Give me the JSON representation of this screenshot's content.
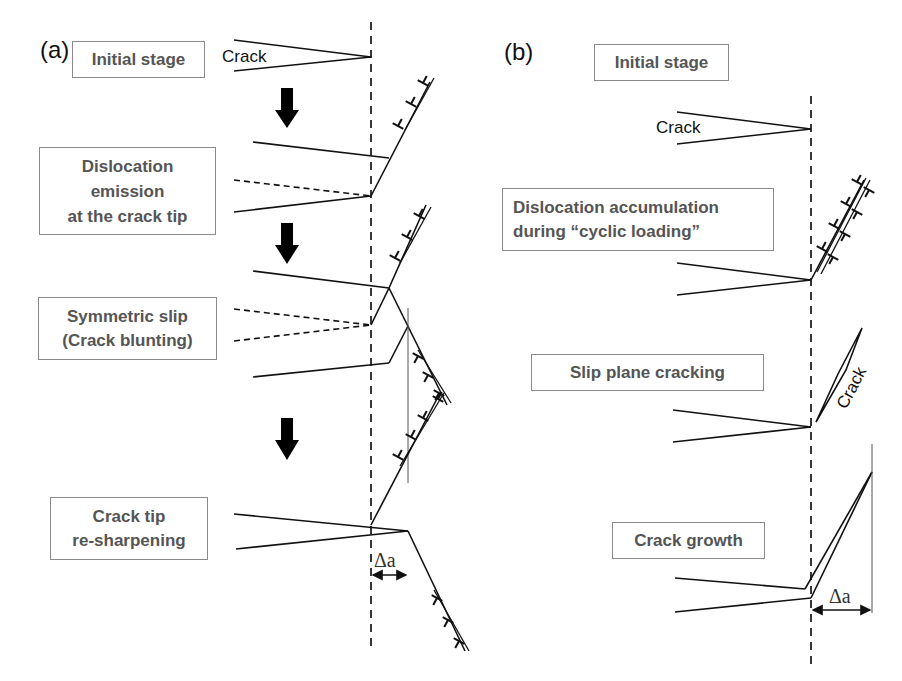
{
  "figure": {
    "panel_a": {
      "label": "(a)",
      "stages": [
        {
          "title": "Initial stage"
        },
        {
          "title": "Dislocation\nemission\nat the crack tip"
        },
        {
          "title": "Symmetric slip\n(Crack blunting)"
        },
        {
          "title": "Crack tip\nre-sharpening"
        }
      ],
      "crack_label": "Crack",
      "delta_label": "Δa"
    },
    "panel_b": {
      "label": "(b)",
      "stages": [
        {
          "title": "Initial stage"
        },
        {
          "title": "Dislocation accumulation\nduring “cyclic loading”"
        },
        {
          "title": "Slip plane cracking"
        },
        {
          "title": "Crack growth"
        }
      ],
      "crack_label": "Crack",
      "rotated_crack_label": "Crack",
      "delta_label": "Δa"
    },
    "colors": {
      "line": "#111111",
      "box_border": "#8a8a8a",
      "box_text": "#555555"
    }
  }
}
